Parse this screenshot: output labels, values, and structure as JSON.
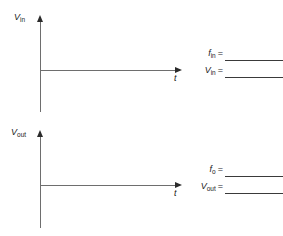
{
  "figure": {
    "background_color": "#ffffff",
    "axis_color": "#6e6e6e",
    "text_color": "#1a1a1a"
  },
  "panels": [
    {
      "id": "input-waveform-panel",
      "vertical_axis_label_symbol": "V",
      "vertical_axis_label_subscript": "in",
      "horizontal_axis_label": "t",
      "plot_area_empty": true,
      "answers": [
        {
          "symbol": "f",
          "subscript": "in",
          "equals": "=",
          "value": ""
        },
        {
          "symbol": "V",
          "subscript": "in",
          "equals": "=",
          "value": ""
        }
      ]
    },
    {
      "id": "output-waveform-panel",
      "vertical_axis_label_symbol": "V",
      "vertical_axis_label_subscript": "out",
      "horizontal_axis_label": "t",
      "plot_area_empty": true,
      "answers": [
        {
          "symbol": "f",
          "subscript": "o",
          "equals": "=",
          "value": ""
        },
        {
          "symbol": "V",
          "subscript": "out",
          "equals": "=",
          "value": ""
        }
      ]
    }
  ],
  "icons": {
    "arrow_up": "axis-arrow-up-icon",
    "arrow_right": "axis-arrow-right-icon"
  }
}
